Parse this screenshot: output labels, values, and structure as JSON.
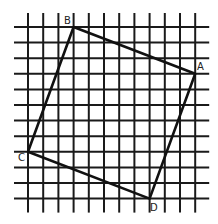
{
  "diagram": {
    "type": "square-on-grid",
    "grid": {
      "columns": 12,
      "rows": 12,
      "x_start": 28,
      "y_start": 27,
      "spacing_x": 15.2,
      "spacing_y": 15.6,
      "extend": 14,
      "line_color": "#1a1a1a",
      "line_width": 2
    },
    "shape": {
      "stroke_color": "#111111",
      "stroke_width": 2.6,
      "vertices": [
        {
          "label": "B",
          "col": 3,
          "row": 0
        },
        {
          "label": "A",
          "col": 11,
          "row": 3
        },
        {
          "label": "D",
          "col": 8,
          "row": 11
        },
        {
          "label": "C",
          "col": 0,
          "row": 8
        }
      ]
    },
    "labels": {
      "A": "A",
      "B": "B",
      "C": "C",
      "D": "D"
    }
  }
}
